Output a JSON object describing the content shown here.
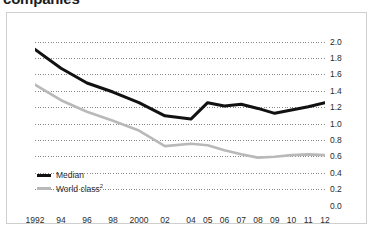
{
  "title": "companies",
  "legend": {
    "median_label": "Median",
    "world_label": "World class",
    "world_footnote": "2"
  },
  "chart_data": {
    "type": "line",
    "title": "companies",
    "xlabel": "",
    "ylabel": "",
    "ylim": [
      0.0,
      2.0
    ],
    "ytick_step": 0.2,
    "grid": true,
    "legend_position": "bottom-left",
    "x": [
      1992,
      1994,
      1996,
      1998,
      2000,
      2002,
      2004,
      2005,
      2006,
      2007,
      2008,
      2009,
      2010,
      2011,
      2012
    ],
    "categories": [
      "1992",
      "94",
      "96",
      "98",
      "2000",
      "02",
      "04",
      "05",
      "06",
      "07",
      "08",
      "09",
      "10",
      "11",
      "12"
    ],
    "yticks": [
      "0.0",
      "0.2",
      "0.4",
      "0.6",
      "0.8",
      "1.0",
      "1.2",
      "1.4",
      "1.6",
      "1.8",
      "2.0"
    ],
    "series": [
      {
        "name": "Median",
        "color": "#111111",
        "values": [
          1.91,
          1.68,
          1.5,
          1.39,
          1.26,
          1.1,
          1.06,
          1.26,
          1.22,
          1.24,
          1.19,
          1.13,
          1.17,
          1.21,
          1.26
        ]
      },
      {
        "name": "World class",
        "color": "#b9b9b9",
        "values": [
          1.48,
          1.29,
          1.15,
          1.04,
          0.92,
          0.73,
          0.76,
          0.74,
          0.68,
          0.63,
          0.59,
          0.6,
          0.62,
          0.63,
          0.62
        ]
      }
    ]
  }
}
